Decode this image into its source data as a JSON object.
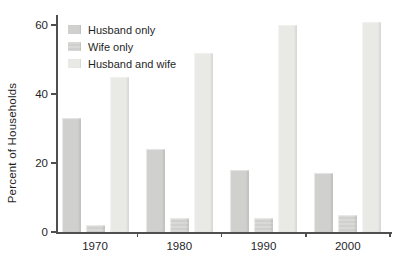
{
  "chart_data": {
    "type": "bar",
    "title": "",
    "xlabel": "",
    "ylabel": "Percent of Households",
    "categories": [
      "1970",
      "1980",
      "1990",
      "2000"
    ],
    "series": [
      {
        "name": "Husband only",
        "values": [
          33,
          24,
          18,
          17
        ],
        "color": "#d0d0ce",
        "striped": false
      },
      {
        "name": "Wife only",
        "values": [
          2,
          4,
          4,
          5
        ],
        "color": "#d9d9d7",
        "striped": true
      },
      {
        "name": "Husband and wife",
        "values": [
          45,
          52,
          60,
          61
        ],
        "color": "#e9e9e6",
        "striped": false
      }
    ],
    "ylim": [
      0,
      60
    ],
    "yticks": [
      0,
      20,
      40,
      60
    ],
    "grid": false,
    "legend_position": "top-left",
    "colors": {
      "axis": "#4f4f4f",
      "text": "#1f1f1f",
      "background": "#ffffff"
    }
  }
}
